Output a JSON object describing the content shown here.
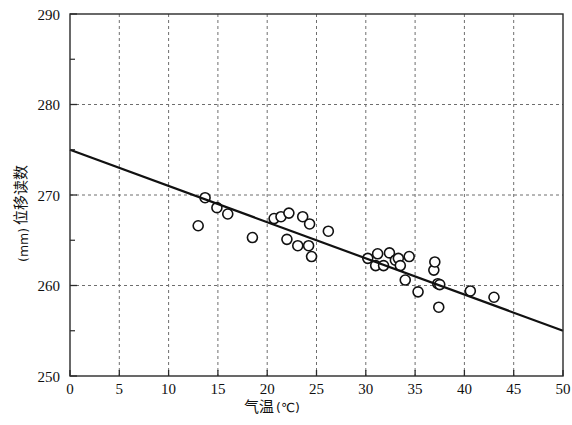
{
  "chart_data": {
    "type": "scatter",
    "title": "",
    "xlabel": "气温(℃)",
    "ylabel": "位移读数(mm)",
    "xlabel_main": "气温",
    "xlabel_unit": "(℃)",
    "ylabel_main": "位移读数",
    "ylabel_unit": "(mm)",
    "xlim": [
      0,
      50
    ],
    "ylim": [
      250,
      290
    ],
    "xticks": [
      0,
      5,
      10,
      15,
      20,
      25,
      30,
      35,
      40,
      45,
      50
    ],
    "xtick_labels": [
      "0",
      "5",
      "10",
      "15",
      "20",
      "25",
      "30",
      "35",
      "40",
      "45",
      "50"
    ],
    "yticks": [
      250,
      260,
      270,
      280,
      290
    ],
    "ytick_labels": [
      "250",
      "260",
      "270",
      "280",
      "290"
    ],
    "y_minor_ticks": [
      255,
      265,
      275,
      285
    ],
    "grid": true,
    "grid_style": "dashed",
    "grid_color": "#6e6e6e",
    "axis_color": "#2a2a2a",
    "marker": "open-circle",
    "marker_color": "#111111",
    "marker_size": 5,
    "series": [
      {
        "name": "位移读数",
        "points": [
          [
            13.0,
            266.6
          ],
          [
            13.7,
            269.7
          ],
          [
            14.9,
            268.6
          ],
          [
            16.0,
            267.9
          ],
          [
            18.5,
            265.3
          ],
          [
            20.7,
            267.4
          ],
          [
            21.4,
            267.6
          ],
          [
            22.2,
            268.0
          ],
          [
            22.0,
            265.1
          ],
          [
            23.1,
            264.4
          ],
          [
            23.6,
            267.6
          ],
          [
            24.3,
            266.8
          ],
          [
            24.5,
            263.2
          ],
          [
            24.2,
            264.4
          ],
          [
            26.2,
            266.0
          ],
          [
            30.2,
            263.0
          ],
          [
            31.0,
            262.2
          ],
          [
            31.2,
            263.5
          ],
          [
            31.8,
            262.2
          ],
          [
            32.4,
            263.6
          ],
          [
            33.0,
            262.8
          ],
          [
            33.3,
            263.0
          ],
          [
            33.5,
            262.2
          ],
          [
            34.4,
            263.2
          ],
          [
            34.0,
            260.6
          ],
          [
            35.3,
            259.3
          ],
          [
            36.9,
            261.7
          ],
          [
            37.0,
            262.6
          ],
          [
            37.3,
            260.2
          ],
          [
            37.5,
            260.1
          ],
          [
            37.4,
            257.6
          ],
          [
            40.6,
            259.4
          ],
          [
            43.0,
            258.7
          ]
        ]
      }
    ],
    "trendline": {
      "name": "回归直线",
      "x0": 0,
      "y0": 275.0,
      "x1": 50,
      "y1": 255.0,
      "slope": -0.4,
      "intercept": 275.0,
      "color": "#111111",
      "width": 2.2
    }
  }
}
